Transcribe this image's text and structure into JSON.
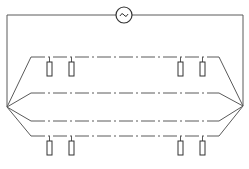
{
  "diagram": {
    "title": "",
    "stroke_color": "#5a5a5a",
    "dash_pattern": "14 3 2 3",
    "source": {
      "symbol": "~",
      "icon": "ac-source-icon",
      "cx": 124,
      "cy": 15,
      "r": 8
    },
    "frame": {
      "left_x": 7,
      "right_x": 243,
      "top_y": 15,
      "left_node": [
        7,
        107
      ],
      "right_node": [
        243,
        106
      ]
    },
    "conductors": [
      {
        "name": "conductor-1",
        "y": 57,
        "left_bend_x": 31,
        "right_bend_x": 219
      },
      {
        "name": "conductor-2",
        "y": 93,
        "left_bend_x": 31,
        "right_bend_x": 219
      },
      {
        "name": "conductor-3",
        "y": 121,
        "left_bend_x": 31,
        "right_bend_x": 219
      },
      {
        "name": "conductor-4",
        "y": 136,
        "left_bend_x": 31,
        "right_bend_x": 219
      }
    ],
    "elements_top": [
      {
        "x": 47,
        "y": 62,
        "w": 5,
        "h": 14
      },
      {
        "x": 69,
        "y": 62,
        "w": 5,
        "h": 14
      },
      {
        "x": 178,
        "y": 62,
        "w": 5,
        "h": 14
      },
      {
        "x": 200,
        "y": 62,
        "w": 5,
        "h": 14
      }
    ],
    "elements_bottom": [
      {
        "x": 47,
        "y": 141,
        "w": 5,
        "h": 14
      },
      {
        "x": 69,
        "y": 141,
        "w": 5,
        "h": 14
      },
      {
        "x": 178,
        "y": 141,
        "w": 5,
        "h": 14
      },
      {
        "x": 200,
        "y": 141,
        "w": 5,
        "h": 14
      }
    ]
  }
}
